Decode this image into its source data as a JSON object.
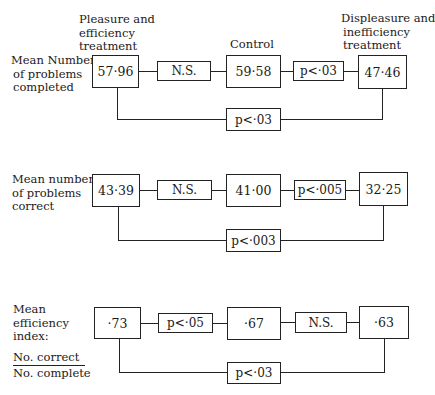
{
  "headers": {
    "pleasure": [
      "Pleasure and",
      "efficiency",
      "treatment"
    ],
    "control": "Control",
    "displeasure": [
      "Displeasure and",
      "inefficiency",
      "treatment"
    ]
  },
  "rows": [
    {
      "label": [
        "Mean Number",
        "of problems",
        "completed"
      ],
      "values": [
        "57·96",
        "59·58",
        "47·46"
      ],
      "sig_1_2": "N.S.",
      "sig_2_3": "p<·03",
      "sig_1_3": "p<·03"
    },
    {
      "label": [
        "Mean number",
        "of problems",
        "correct"
      ],
      "values": [
        "43·39",
        "41·00",
        "32·25"
      ],
      "sig_1_2": "N.S.",
      "sig_2_3": "p<·005",
      "sig_1_3": "p<·003"
    },
    {
      "label": [
        "Mean",
        "efficiency",
        "index:"
      ],
      "fraction": {
        "numerator": "No. correct",
        "denominator": "No. complete"
      },
      "values": [
        "·73",
        "·67",
        "·63"
      ],
      "sig_1_2": "p<·05",
      "sig_2_3": "N.S.",
      "sig_1_3": "p<·03"
    }
  ]
}
